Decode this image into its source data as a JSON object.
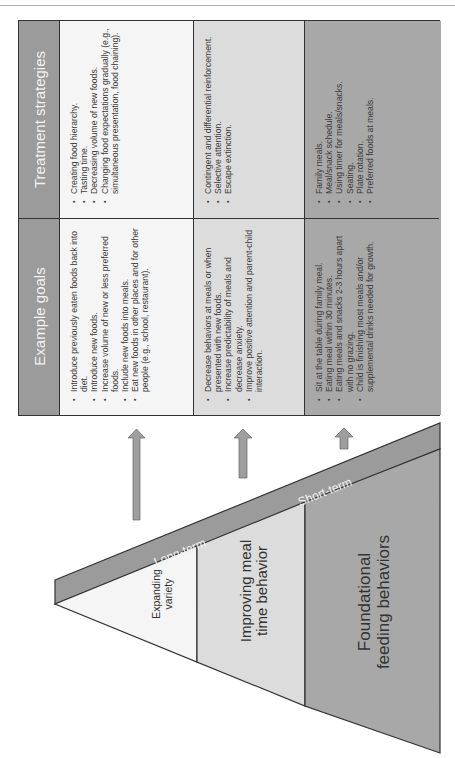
{
  "table": {
    "headers": [
      {
        "label": "Example goals"
      },
      {
        "label": "Treatment strategies"
      }
    ],
    "rows": [
      {
        "level": "Expanding variety",
        "color": "#f5f5f5",
        "goals": [
          "Introduce previously eaten foods back into diet.",
          "Introduce new foods.",
          "Increase volume of new or less preferred foods.",
          "Include new foods into meals.",
          "Eat new foods in other places and for other people (e.g., school, restaurant)."
        ],
        "strategies": [
          "Creating food hierarchy.",
          "Tasting time.",
          "Decreasing volume of new foods.",
          "Changing food expectations gradually (e.g., simultaneous presentation, food chaining)."
        ]
      },
      {
        "level": "Improving meal time behavior",
        "color": "#dcdcdc",
        "goals": [
          "Decrease behaviors at meals or when presented with new foods.",
          "Increase predictability of meals and decrease anxiety.",
          "Improve positive attention and parent-child interaction."
        ],
        "strategies": [
          "Contingent and differential reinforcement.",
          "Selective attention.",
          "Escape extinction."
        ]
      },
      {
        "level": "Foundational feeding behaviors",
        "color": "#a8a8a8",
        "goals": [
          "Sit at the table during family meal.",
          "Eating meal within 30 minutes.",
          "Eating meals and snacks 2-3 hours apart with no grazing.",
          "Child is finishing most meals and/or supplemental drinks needed for growth."
        ],
        "strategies": [
          "Family meals.",
          "Meal/snack schedule.",
          "Using timer for meals/snacks.",
          "Seating.",
          "Plate rotation.",
          "Preferred foods at meals."
        ]
      }
    ]
  },
  "pyramid": {
    "band_labels": {
      "long_term": "Long-term",
      "short_term": "Short-term"
    },
    "levels": [
      {
        "lines": [
          "Expanding",
          "variety"
        ]
      },
      {
        "lines": [
          "Improving meal",
          "time behavior"
        ]
      },
      {
        "lines": [
          "Foundational",
          "feeding behaviors"
        ]
      }
    ]
  },
  "colors": {
    "header": "#9b9b9b",
    "band": "#9b9b9b",
    "level1": "#f5f5f5",
    "level2": "#dcdcdc",
    "level3": "#a8a8a8",
    "arrow": "#9e9e9e",
    "border": "#333333"
  }
}
